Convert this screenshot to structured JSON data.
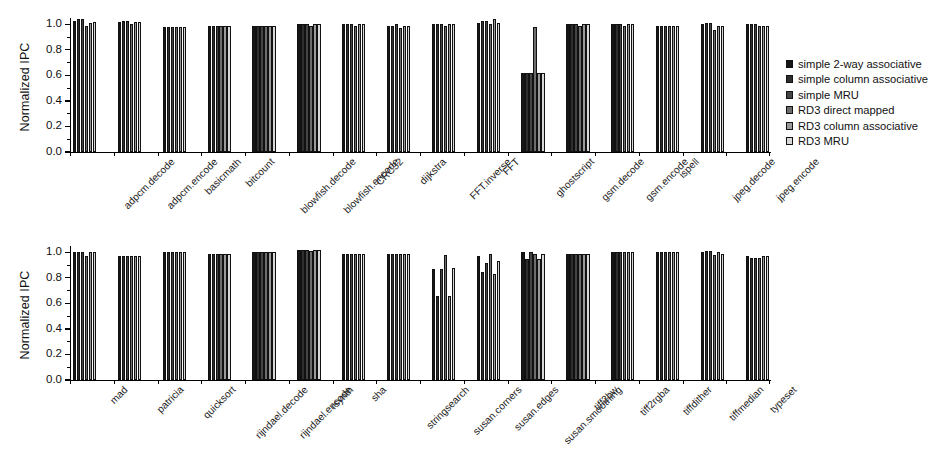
{
  "figure": {
    "ylabel": "Normalized IPC",
    "yticks_major": [
      "1.0",
      "0.8",
      "0.6",
      "0.4",
      "0.2",
      "0.0"
    ],
    "ylim": [
      0.0,
      1.05
    ]
  },
  "legend": {
    "position": "right",
    "items": [
      {
        "label": "simple 2-way associative",
        "color": "#151515"
      },
      {
        "label": "simple column associative",
        "color": "#2e2e2e"
      },
      {
        "label": "simple MRU",
        "color": "#444444"
      },
      {
        "label": "RD3 direct mapped",
        "color": "#6d6d6d"
      },
      {
        "label": "RD3 column associative",
        "color": "#9a9a9a"
      },
      {
        "label": "RD3 MRU",
        "color": "#d8d8d8"
      }
    ]
  },
  "chart_data": [
    {
      "type": "bar",
      "title": "",
      "xlabel": "",
      "ylabel": "Normalized IPC",
      "ylim": [
        0.0,
        1.05
      ],
      "grid": false,
      "legend_position": "right",
      "panel": "top",
      "categories": [
        "adpcm.decode",
        "adpcm.encode",
        "basicmath",
        "bitcount",
        "blowfish.decode",
        "blowfish.encode",
        "CRC32",
        "dijkstra",
        "FFT.inverse",
        "FFT",
        "ghostscript",
        "gsm.decode",
        "gsm.encode",
        "ispell",
        "jpeg.decode",
        "jpeg.encode"
      ],
      "series": [
        {
          "name": "simple 2-way associative",
          "values": [
            1.03,
            1.02,
            0.98,
            0.99,
            0.99,
            1.0,
            1.0,
            0.99,
            1.0,
            1.01,
            0.62,
            1.0,
            1.0,
            0.99,
            1.0,
            1.0
          ]
        },
        {
          "name": "simple column associative",
          "values": [
            1.04,
            1.03,
            0.98,
            0.99,
            0.99,
            1.0,
            1.0,
            0.99,
            1.0,
            1.03,
            0.62,
            1.0,
            1.0,
            0.99,
            1.01,
            1.0
          ]
        },
        {
          "name": "simple MRU",
          "values": [
            1.04,
            1.03,
            0.98,
            0.99,
            0.99,
            1.0,
            1.0,
            1.0,
            1.0,
            1.03,
            0.62,
            1.0,
            1.0,
            0.99,
            1.01,
            1.0
          ]
        },
        {
          "name": "RD3 direct mapped",
          "values": [
            0.99,
            1.0,
            0.98,
            0.99,
            0.99,
            0.99,
            0.99,
            0.97,
            0.99,
            1.0,
            0.98,
            0.99,
            0.99,
            0.99,
            0.96,
            0.99
          ]
        },
        {
          "name": "RD3 column associative",
          "values": [
            1.01,
            1.02,
            0.98,
            0.99,
            0.99,
            1.0,
            1.0,
            0.99,
            1.0,
            1.04,
            0.62,
            1.0,
            1.0,
            0.99,
            0.99,
            0.99
          ]
        },
        {
          "name": "RD3 MRU",
          "values": [
            1.02,
            1.02,
            0.98,
            0.99,
            0.99,
            1.0,
            1.0,
            0.99,
            1.0,
            1.01,
            0.62,
            1.0,
            1.0,
            0.99,
            0.99,
            0.99
          ]
        }
      ]
    },
    {
      "type": "bar",
      "title": "",
      "xlabel": "",
      "ylabel": "Normalized IPC",
      "ylim": [
        0.0,
        1.05
      ],
      "grid": false,
      "legend_position": "right",
      "panel": "bottom",
      "categories": [
        "mad",
        "patricia",
        "quicksort",
        "rijndael.decode",
        "rijndael.encode",
        "rsynth",
        "sha",
        "stringsearch",
        "susan.corners",
        "susan.edges",
        "susan.smoothing",
        "tiff2bw",
        "tiff2rgba",
        "tiffdither",
        "tiffmedian",
        "typeset"
      ],
      "series": [
        {
          "name": "simple 2-way associative",
          "values": [
            1.0,
            0.97,
            1.0,
            0.99,
            1.0,
            1.02,
            0.99,
            0.99,
            0.87,
            0.97,
            1.0,
            0.99,
            1.0,
            1.0,
            1.0,
            0.97
          ]
        },
        {
          "name": "simple column associative",
          "values": [
            1.0,
            0.97,
            1.0,
            0.99,
            1.0,
            1.02,
            0.99,
            0.99,
            0.66,
            0.85,
            0.95,
            0.99,
            1.0,
            1.0,
            1.01,
            0.96
          ]
        },
        {
          "name": "simple MRU",
          "values": [
            1.0,
            0.97,
            1.0,
            0.99,
            1.0,
            1.02,
            0.99,
            0.99,
            0.87,
            0.92,
            1.0,
            0.99,
            1.0,
            1.0,
            1.01,
            0.96
          ]
        },
        {
          "name": "RD3 direct mapped",
          "values": [
            0.97,
            0.97,
            1.0,
            0.99,
            1.0,
            1.01,
            0.99,
            0.99,
            0.98,
            0.99,
            0.99,
            0.99,
            1.0,
            1.0,
            0.98,
            0.96
          ]
        },
        {
          "name": "RD3 column associative",
          "values": [
            1.0,
            0.97,
            1.0,
            0.99,
            1.0,
            1.02,
            0.99,
            0.99,
            0.66,
            0.83,
            0.95,
            0.99,
            1.0,
            1.0,
            1.0,
            0.97
          ]
        },
        {
          "name": "RD3 MRU",
          "values": [
            1.0,
            0.97,
            1.0,
            0.99,
            1.0,
            1.02,
            0.99,
            0.99,
            0.88,
            0.93,
            0.99,
            0.99,
            1.0,
            1.0,
            0.99,
            0.97
          ]
        }
      ]
    }
  ]
}
